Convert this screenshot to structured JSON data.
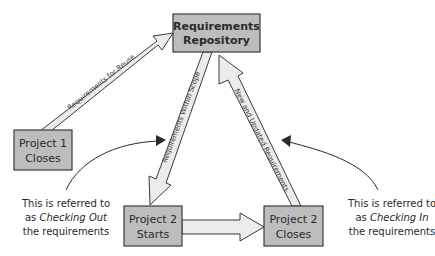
{
  "nodes": {
    "repository": {
      "line1": "Requirements",
      "line2": "Repository"
    },
    "project1_closes": {
      "line1": "Project 1",
      "line2": "Closes"
    },
    "project2_starts": {
      "line1": "Project 2",
      "line2": "Starts"
    },
    "project2_closes": {
      "line1": "Project 2",
      "line2": "Closes"
    }
  },
  "edges": {
    "reuse": {
      "label": "Requirements for Reuse",
      "from": "Project 1 Closes",
      "to": "Requirements Repository"
    },
    "within_scope": {
      "label": "Requirements Within Scope",
      "from": "Requirements Repository",
      "to": "Project 2 Starts"
    },
    "new_updated": {
      "label": "New and Updated Requirements",
      "from": "Project 2 Closes",
      "to": "Requirements Repository"
    },
    "start_to_close": {
      "label": "",
      "from": "Project 2 Starts",
      "to": "Project 2 Closes"
    }
  },
  "annotations": {
    "checking_out": {
      "line1": "This is referred to",
      "line2_prefix": "as ",
      "line2_em": "Checking Out",
      "line3": "the requirements"
    },
    "checking_in": {
      "line1": "This is referred to",
      "line2_prefix": "as ",
      "line2_em": "Checking In",
      "line3": "the requirements"
    }
  },
  "colors": {
    "box_fill": "#bdbdbd",
    "arrow_fill": "#ececec",
    "stroke": "#3a3a3a"
  }
}
